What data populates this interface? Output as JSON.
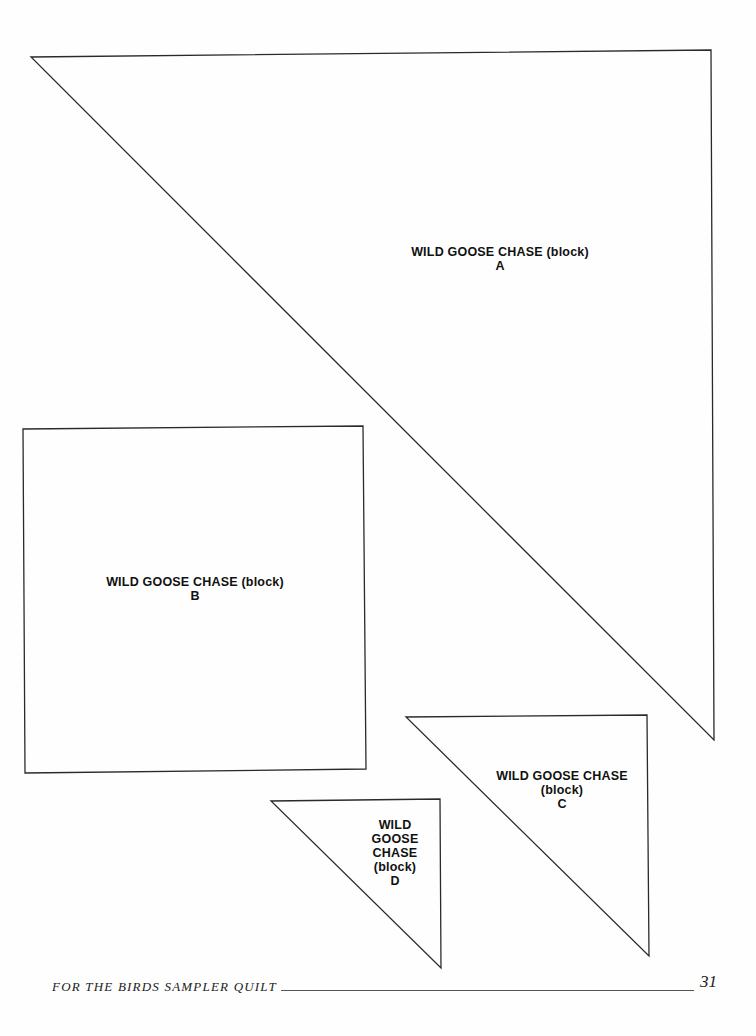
{
  "pieces": [
    {
      "id": "A",
      "shape": "triangle",
      "lines": [
        "WILD GOOSE CHASE (block)",
        "A"
      ]
    },
    {
      "id": "B",
      "shape": "square",
      "lines": [
        "WILD GOOSE CHASE (block)",
        "B"
      ]
    },
    {
      "id": "C",
      "shape": "triangle",
      "lines": [
        "WILD GOOSE CHASE",
        "(block)",
        "C"
      ]
    },
    {
      "id": "D",
      "shape": "triangle",
      "lines": [
        "WILD",
        "GOOSE",
        "CHASE",
        "(block)",
        "D"
      ]
    }
  ],
  "footer": {
    "title": "FOR THE BIRDS SAMPLER QUILT",
    "page_number": "31"
  }
}
